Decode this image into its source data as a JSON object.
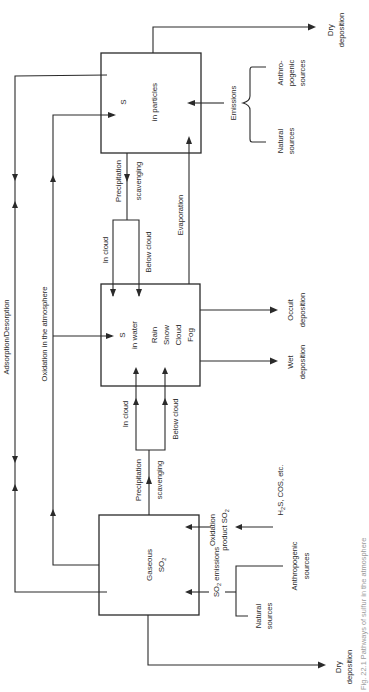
{
  "diagram": {
    "orientation": "rotated 90 degrees counter-clockwise",
    "nodes": {
      "particles": {
        "line1": "S",
        "line2": "in particles"
      },
      "water": {
        "line1": "S",
        "line2": "in water",
        "forms": [
          "Rain",
          "Snow",
          "Cloud",
          "Fog"
        ]
      },
      "gaseous": {
        "line1": "Gaseous",
        "line2_main": "SO",
        "line2_sub": "2"
      }
    },
    "edges": {
      "adsorption_desorption": "Adsorption/Desorption",
      "oxidation_atmosphere": "Oxidation in the atmosphere",
      "upper_scavenging": {
        "line1": "Precipitation",
        "line2": "scavenging",
        "in_cloud": "In cloud",
        "below_cloud": "Below cloud"
      },
      "lower_scavenging": {
        "line1": "Precipitation",
        "line2": "scavenging",
        "in_cloud": "In cloud",
        "below_cloud": "Below cloud"
      },
      "evaporation": "Evaporation"
    },
    "sinks": {
      "particles_dry": {
        "line1": "Dry",
        "line2": "deposition"
      },
      "gaseous_dry": {
        "line1": "Dry",
        "line2": "deposition"
      },
      "wet": {
        "line1": "Wet",
        "line2": "deposition"
      },
      "occult": {
        "line1": "Occult",
        "line2": "deposition"
      }
    },
    "sources": {
      "particle_emissions": {
        "label": "Emissions",
        "anthropogenic": [
          "Anthro-",
          "pogenic",
          "sources"
        ],
        "natural": [
          "Natural",
          "sources"
        ]
      },
      "so2_emissions": {
        "label_main": "SO",
        "label_sub": "2",
        "label_rest": " emissions",
        "anthropogenic": [
          "Anthropogenic",
          "sources"
        ],
        "natural": [
          "Natural",
          "sources"
        ]
      },
      "oxidation_product": {
        "line1": "Oxidation",
        "line2_main": "product SO",
        "line2_sub": "2",
        "precursors_h": "H",
        "precursors_sub": "2",
        "precursors_rest": "S, COS, etc."
      }
    },
    "caption": "Fig. 22.1  Pathways of sulfur in the atmosphere"
  }
}
